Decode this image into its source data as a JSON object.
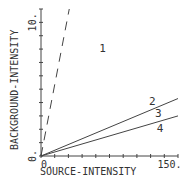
{
  "chart_data": {
    "type": "line",
    "title": "",
    "xlabel": "SOURCE-INTENSITY",
    "ylabel": "BACKGROUND-INTENSITY",
    "xlim": [
      0,
      160
    ],
    "ylim": [
      0,
      11
    ],
    "x_tick_labels": [
      {
        "value": 0,
        "label": "0."
      },
      {
        "value": 150,
        "label": "150."
      }
    ],
    "y_tick_labels": [
      {
        "value": 0,
        "label": "0."
      },
      {
        "value": 10,
        "label": "10."
      }
    ],
    "x_minor_ticks": [
      0,
      16,
      32,
      48,
      64,
      80,
      96,
      112,
      128,
      144,
      160
    ],
    "y_minor_ticks": [
      0,
      1,
      2,
      3,
      4,
      5,
      6,
      7,
      8,
      9,
      10,
      11
    ],
    "grid": false,
    "series": [
      {
        "name": "dashed-boundary",
        "style": "dashed",
        "points": [
          [
            0,
            0
          ],
          [
            33,
            11
          ]
        ]
      },
      {
        "name": "line-2",
        "style": "solid",
        "points": [
          [
            0,
            0
          ],
          [
            160,
            4.3
          ]
        ]
      },
      {
        "name": "line-3",
        "style": "solid",
        "points": [
          [
            0,
            0
          ],
          [
            160,
            3.0
          ]
        ]
      }
    ],
    "annotations": [
      {
        "label": "1",
        "x": 72,
        "y": 7.8
      },
      {
        "label": "2",
        "x": 130,
        "y": 3.8
      },
      {
        "label": "3",
        "x": 137,
        "y": 2.9
      },
      {
        "label": "4",
        "x": 139,
        "y": 1.8
      }
    ]
  }
}
